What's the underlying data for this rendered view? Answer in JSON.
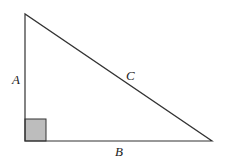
{
  "diagram": {
    "type": "right-triangle",
    "labels": {
      "vertical_side": "A",
      "horizontal_side": "B",
      "hypotenuse": "C"
    },
    "right_angle_marker": {
      "fill": "#bdbdbd",
      "stroke": "#333333"
    },
    "colors": {
      "line": "#333333",
      "background": "#ffffff"
    }
  }
}
